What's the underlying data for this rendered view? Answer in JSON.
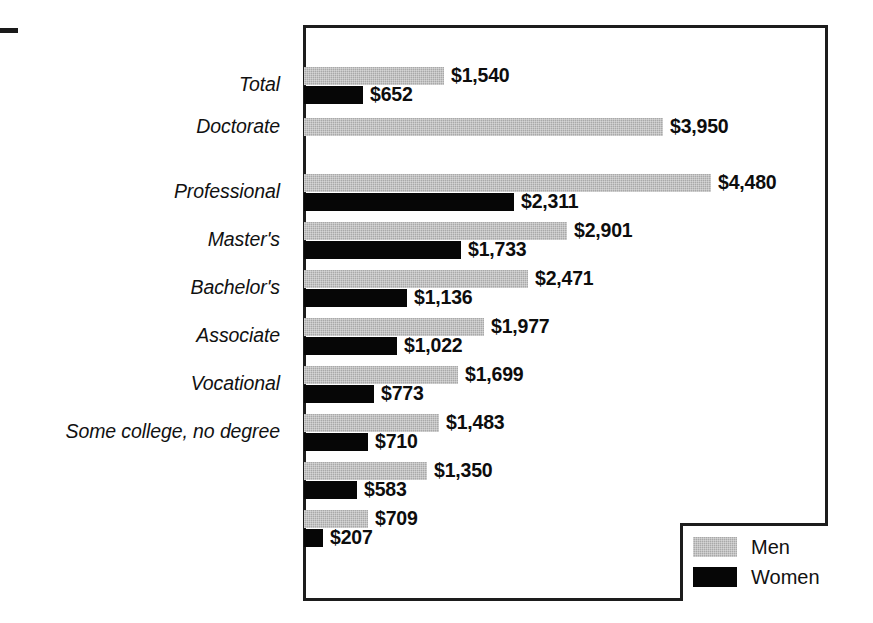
{
  "chart_data": {
    "type": "bar",
    "orientation": "horizontal",
    "title": "",
    "subtitle": "",
    "xlabel": "",
    "ylabel": "",
    "grid": false,
    "axis_visible": false,
    "xlim": [
      0,
      4600
    ],
    "legend_position": "bottom-right",
    "value_prefix": "$",
    "categories": [
      "Total",
      "Doctorate",
      "Professional",
      "Master's",
      "Bachelor's",
      "Associate",
      "Vocational",
      "Some college, no degree",
      "",
      ""
    ],
    "series": [
      {
        "name": "Men",
        "color": "#a9a9a9",
        "values": [
          1540,
          3950,
          4480,
          2901,
          2471,
          1977,
          1699,
          1483,
          1350,
          709
        ],
        "labels": [
          "$1,540",
          "$3,950",
          "$4,480",
          "$2,901",
          "$2,471",
          "$1,977",
          "$1,699",
          "$1,483",
          "$1,350",
          "$709"
        ]
      },
      {
        "name": "Women",
        "color": "#060606",
        "values": [
          652,
          null,
          2311,
          1733,
          1136,
          1022,
          773,
          710,
          583,
          207
        ],
        "labels": [
          "$652",
          "",
          "$2,311",
          "$1,733",
          "$1,136",
          "$1,022",
          "$773",
          "$710",
          "$583",
          "$207"
        ]
      }
    ]
  },
  "legend": {
    "entries": [
      {
        "label": "Men",
        "color": "#a9a9a9"
      },
      {
        "label": "Women",
        "color": "#060606"
      }
    ]
  }
}
